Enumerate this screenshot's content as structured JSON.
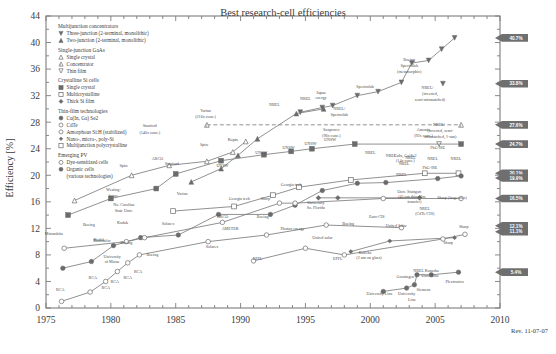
{
  "chart_data": {
    "type": "line",
    "title": "Best research-cell efficiencies",
    "xlabel": "",
    "ylabel": "Efficiency [%]",
    "xlim": [
      1975,
      2010
    ],
    "ylim": [
      0,
      44
    ],
    "xticks": [
      "1975",
      "1980",
      "1985",
      "1990",
      "1995",
      "2000",
      "2005",
      "2010"
    ],
    "yticks": [
      "0",
      "4",
      "8",
      "12",
      "16",
      "20",
      "24",
      "28",
      "32",
      "36",
      "40",
      "44"
    ],
    "grid": false,
    "revision": "Rev. 11-07-07",
    "legend_position": "upper-left-inside",
    "legend_groups": [
      {
        "heading": "Multijunction concentrators",
        "items": [
          {
            "marker": "triangle-down-filled",
            "label": "Three-junction (2-terminal, monolithic)"
          },
          {
            "marker": "triangle-up-filled",
            "label": "Two-junction (2-terminal, monolithic)"
          }
        ]
      },
      {
        "heading": "Single-junction GaAs",
        "items": [
          {
            "marker": "triangle-up-open",
            "label": "Single crystal"
          },
          {
            "marker": "triangle-up-half",
            "label": "Concentrator"
          },
          {
            "marker": "triangle-down-open",
            "label": "Thin film"
          }
        ]
      },
      {
        "heading": "Crystalline Si cells",
        "items": [
          {
            "marker": "square-filled",
            "label": "Single crystal"
          },
          {
            "marker": "square-open",
            "label": "Multicrystalline"
          },
          {
            "marker": "diamond-filled",
            "label": "Thick Si film"
          }
        ]
      },
      {
        "heading": "Thin-film technologies",
        "items": [
          {
            "marker": "circle-filled",
            "label": "Cu(In, Ga) Se2"
          },
          {
            "marker": "circle-open",
            "label": "CdTe"
          },
          {
            "marker": "circle-open",
            "label": "Amorphous Si:H (stabilized)"
          },
          {
            "marker": "diamond-small-filled",
            "label": "Nano-, micro-, poly-Si"
          },
          {
            "marker": "square-open",
            "label": "Multijunction polycrystalline"
          }
        ]
      },
      {
        "heading": "Emerging PV",
        "items": [
          {
            "marker": "circle-open",
            "label": "Dye-sensitized cells"
          },
          {
            "marker": "circle-filled",
            "label": "Organic cells"
          },
          {
            "marker": "none",
            "label": "(various technologies)"
          }
        ]
      }
    ],
    "callouts": [
      {
        "value": "40.7%",
        "y": 40.7
      },
      {
        "value": "33.8%",
        "y": 33.8
      },
      {
        "value": "27.6%",
        "y": 27.6
      },
      {
        "value": "24.7%",
        "y": 24.7
      },
      {
        "value": "20.1%",
        "y": 20.3
      },
      {
        "value": "19.9%",
        "y": 19.6
      },
      {
        "value": "16.5%",
        "y": 16.5
      },
      {
        "value": "12.1%",
        "y": 12.4
      },
      {
        "value": "11.1%",
        "y": 11.5
      },
      {
        "value": "5.4%",
        "y": 5.4
      }
    ],
    "annotations": [
      {
        "text": "Varian",
        "x": 1987.3,
        "y": 29.6
      },
      {
        "text": "(216x conc.)",
        "x": 1987.3,
        "y": 28.6
      },
      {
        "text": "Stanford",
        "x": 1983.0,
        "y": 27.2
      },
      {
        "text": "(140x conc.)",
        "x": 1983.0,
        "y": 26.2
      },
      {
        "text": "Spire",
        "x": 1987.2,
        "y": 24.4
      },
      {
        "text": "Kopin",
        "x": 1989.4,
        "y": 25.2
      },
      {
        "text": "NREL",
        "x": 1992.6,
        "y": 30.4
      },
      {
        "text": "NREL",
        "x": 1995.0,
        "y": 31.4
      },
      {
        "text": "Japan",
        "x": 1996.2,
        "y": 32.3
      },
      {
        "text": "energy",
        "x": 1996.2,
        "y": 31.5
      },
      {
        "text": "Spectrolab",
        "x": 1999.6,
        "y": 33.2
      },
      {
        "text": "NREL/",
        "x": 1997.6,
        "y": 29.9
      },
      {
        "text": "Spectrolab",
        "x": 1997.6,
        "y": 29.0
      },
      {
        "text": "Boeing",
        "x": 2003.0,
        "y": 37.2
      },
      {
        "text": "Spectrolab",
        "x": 2003.0,
        "y": 36.3
      },
      {
        "text": "(metamorphic)",
        "x": 2003.0,
        "y": 35.4
      },
      {
        "text": "NREL/",
        "x": 2004.4,
        "y": 33.0
      },
      {
        "text": "(inverted,",
        "x": 2004.6,
        "y": 32.1
      },
      {
        "text": "semi-mismatched)",
        "x": 2004.6,
        "y": 31.2
      },
      {
        "text": "NREL/",
        "x": 2005.3,
        "y": 27.4
      },
      {
        "text": "(inverted, semi-",
        "x": 2005.4,
        "y": 26.5
      },
      {
        "text": "mismatched, 1-sun)",
        "x": 2005.4,
        "y": 25.6
      },
      {
        "text": "Sunpower",
        "x": 1997.0,
        "y": 26.6
      },
      {
        "text": "(96x conc.)",
        "x": 1997.0,
        "y": 25.8
      },
      {
        "text": "Amonix",
        "x": 2004.1,
        "y": 26.6
      },
      {
        "text": "(92x conc.)",
        "x": 2004.1,
        "y": 25.8
      },
      {
        "text": "FhG-ISE",
        "x": 2005.2,
        "y": 24.0
      },
      {
        "text": "FhG-ISE",
        "x": 2004.6,
        "y": 20.9
      },
      {
        "text": "Stanford",
        "x": 1984.7,
        "y": 21.6
      },
      {
        "text": "Spire",
        "x": 1981.0,
        "y": 21.3
      },
      {
        "text": "Varian",
        "x": 1985.5,
        "y": 17.0
      },
      {
        "text": "ARCO",
        "x": 1983.6,
        "y": 22.3
      },
      {
        "text": "UNSW",
        "x": 1988.6,
        "y": 21.2
      },
      {
        "text": "UNSW",
        "x": 1991.6,
        "y": 23.2
      },
      {
        "text": "UNSW",
        "x": 1993.7,
        "y": 24.0
      },
      {
        "text": "UNSW",
        "x": 1995.4,
        "y": 24.5
      },
      {
        "text": "UNSW",
        "x": 1996.9,
        "y": 25.2
      },
      {
        "text": "NREL",
        "x": 2000.0,
        "y": 23.2
      },
      {
        "text": "NREL",
        "x": 2001.6,
        "y": 22.7
      },
      {
        "text": "NREL",
        "x": 2003.1,
        "y": 22.4
      },
      {
        "text": "NREL",
        "x": 2004.8,
        "y": 22.3
      },
      {
        "text": "NREL",
        "x": 2006.6,
        "y": 22.3
      },
      {
        "text": "NREL",
        "x": 2002.6,
        "y": 21.5
      },
      {
        "text": "NREL",
        "x": 2002.4,
        "y": 19.9
      },
      {
        "text": "CuIn, Ga)Se2",
        "x": 2002.7,
        "y": 22.8
      },
      {
        "text": "(14x conc.)",
        "x": 2002.7,
        "y": 22.0
      },
      {
        "text": "Georgia tech",
        "x": 1989.9,
        "y": 16.2
      },
      {
        "text": "Georgia tech",
        "x": 1993.9,
        "y": 18.4
      },
      {
        "text": "Sharp",
        "x": 1991.9,
        "y": 16.2
      },
      {
        "text": "Univ. Stuttgart",
        "x": 2003.0,
        "y": 17.4
      },
      {
        "text": "(45 um thin-film",
        "x": 2003.2,
        "y": 16.6
      },
      {
        "text": "transfer)",
        "x": 2003.4,
        "y": 15.8
      },
      {
        "text": "Sharp (large-area)",
        "x": 2006.3,
        "y": 16.4
      },
      {
        "text": "NREL",
        "x": 2004.2,
        "y": 14.8
      },
      {
        "text": "(CdTe/CIS)",
        "x": 2004.2,
        "y": 14.0
      },
      {
        "text": "Westing-",
        "x": 1980.2,
        "y": 17.6
      },
      {
        "text": "house",
        "x": 1980.2,
        "y": 16.8
      },
      {
        "text": "No. Carolina",
        "x": 1981.0,
        "y": 15.3
      },
      {
        "text": "State Univ.",
        "x": 1981.0,
        "y": 14.5
      },
      {
        "text": "University",
        "x": 1995.8,
        "y": 15.7
      },
      {
        "text": "So. Florida",
        "x": 1995.8,
        "y": 14.9
      },
      {
        "text": "Euro-CIS",
        "x": 2000.5,
        "y": 13.6
      },
      {
        "text": "Solarex",
        "x": 1984.4,
        "y": 12.5
      },
      {
        "text": "Solarex",
        "x": 1987.8,
        "y": 9.1
      },
      {
        "text": "Kodak",
        "x": 1980.9,
        "y": 12.7
      },
      {
        "text": "Kodak",
        "x": 1979.1,
        "y": 10.1
      },
      {
        "text": "Boeing",
        "x": 1978.3,
        "y": 12.3
      },
      {
        "text": "Boeing",
        "x": 1981.2,
        "y": 9.7
      },
      {
        "text": "Boeing",
        "x": 1991.7,
        "y": 13.6
      },
      {
        "text": "Boeing",
        "x": 1998.3,
        "y": 12.5
      },
      {
        "text": "ARCO",
        "x": 1988.6,
        "y": 13.6
      },
      {
        "text": "AMETEK",
        "x": 1989.2,
        "y": 11.7
      },
      {
        "text": "Photon energy",
        "x": 1994.0,
        "y": 11.8
      },
      {
        "text": "Matsushita",
        "x": 1975.6,
        "y": 11.0
      },
      {
        "text": "Monosolar",
        "x": 1979.3,
        "y": 9.9
      },
      {
        "text": "University",
        "x": 1980.1,
        "y": 7.6
      },
      {
        "text": "of Maine",
        "x": 1980.1,
        "y": 6.8
      },
      {
        "text": "Boeing",
        "x": 1983.2,
        "y": 7.9
      },
      {
        "text": "United solar",
        "x": 1996.3,
        "y": 10.4
      },
      {
        "text": "United Solar",
        "x": 2002.0,
        "y": 12.2
      },
      {
        "text": "EPFL",
        "x": 1991.3,
        "y": 7.3
      },
      {
        "text": "EPFL",
        "x": 1997.5,
        "y": 7.2
      },
      {
        "text": "Kaneka",
        "x": 1999.6,
        "y": 8.2
      },
      {
        "text": "(2 um on glass)",
        "x": 1999.9,
        "y": 7.4
      },
      {
        "text": "Sharp",
        "x": 2006.0,
        "y": 9.6
      },
      {
        "text": "Sharp",
        "x": 2007.2,
        "y": 12.1
      },
      {
        "text": "RCA",
        "x": 1976.1,
        "y": 2.6
      },
      {
        "text": "RCA",
        "x": 1978.6,
        "y": 4.4
      },
      {
        "text": "RCA",
        "x": 1979.6,
        "y": 2.9
      },
      {
        "text": "RCA",
        "x": 1980.3,
        "y": 3.8
      },
      {
        "text": "RCA",
        "x": 1981.3,
        "y": 4.4
      },
      {
        "text": "RCA",
        "x": 1982.1,
        "y": 5.2
      },
      {
        "text": "University Linz",
        "x": 2000.7,
        "y": 1.9
      },
      {
        "text": "University",
        "x": 2002.8,
        "y": 1.9
      },
      {
        "text": "Linz",
        "x": 2003.2,
        "y": 1.1
      },
      {
        "text": "Groningen",
        "x": 2002.7,
        "y": 4.5
      },
      {
        "text": "Siemens",
        "x": 2004.1,
        "y": 2.6
      },
      {
        "text": "NREL Konarka",
        "x": 2004.3,
        "y": 5.5
      },
      {
        "text": "Univ. Linz",
        "x": 2004.6,
        "y": 4.7
      },
      {
        "text": "Plextronics",
        "x": 2006.5,
        "y": 3.7
      }
    ],
    "series": [
      {
        "name": "Three-junction concentrator",
        "marker": "triangle-down-filled",
        "points": [
          [
            1994.6,
            29.5
          ],
          [
            1996.3,
            30.2
          ],
          [
            1997.1,
            30.5
          ],
          [
            1999.0,
            32.0
          ],
          [
            2000.6,
            32.6
          ],
          [
            2002.4,
            34.0
          ],
          [
            2003.2,
            36.9
          ],
          [
            2004.5,
            37.3
          ],
          [
            2005.5,
            39.0
          ],
          [
            2006.5,
            40.7
          ]
        ]
      },
      {
        "name": "Three-junction 1-sun",
        "marker": "triangle-down-filled",
        "points": [
          [
            2005.6,
            33.8
          ]
        ]
      },
      {
        "name": "Two-junction concentrator",
        "marker": "triangle-up-filled",
        "points": [
          [
            1986.2,
            19.0
          ],
          [
            1988.5,
            21.0
          ],
          [
            1989.8,
            23.0
          ],
          [
            1991.3,
            25.5
          ],
          [
            1994.3,
            29.3
          ],
          [
            1996.4,
            30.0
          ]
        ]
      },
      {
        "name": "GaAs concentrator",
        "marker": "triangle-up-half",
        "points": [
          [
            1987.4,
            27.6
          ],
          [
            2007.0,
            27.6
          ]
        ]
      },
      {
        "name": "GaAs single crystal",
        "marker": "triangle-up-open",
        "points": [
          [
            1977.2,
            16.2
          ],
          [
            1981.6,
            20.0
          ],
          [
            1984.5,
            21.5
          ],
          [
            1987.4,
            22.1
          ],
          [
            1989.4,
            23.5
          ],
          [
            1990.4,
            25.1
          ]
        ]
      },
      {
        "name": "GaAs thin film",
        "marker": "triangle-down-open",
        "points": [
          [
            2005.3,
            24.7
          ]
        ]
      },
      {
        "name": "Si single crystal",
        "marker": "square-filled",
        "points": [
          [
            1976.7,
            14.0
          ],
          [
            1980.0,
            16.5
          ],
          [
            1983.5,
            18.0
          ],
          [
            1985.0,
            20.2
          ],
          [
            1988.5,
            22.2
          ],
          [
            1991.8,
            23.1
          ],
          [
            1993.9,
            23.6
          ],
          [
            1995.5,
            24.0
          ],
          [
            1998.8,
            24.7
          ],
          [
            2007.0,
            24.7
          ]
        ]
      },
      {
        "name": "Si multicrystalline",
        "marker": "square-open",
        "points": [
          [
            1984.8,
            14.6
          ],
          [
            1989.5,
            15.3
          ],
          [
            1992.5,
            17.0
          ],
          [
            1994.5,
            18.2
          ],
          [
            1998.5,
            19.3
          ],
          [
            2004.2,
            20.3
          ],
          [
            2006.8,
            20.3
          ]
        ]
      },
      {
        "name": "Thick Si film",
        "marker": "diamond-filled",
        "points": [
          [
            1996.0,
            16.6
          ],
          [
            1997.5,
            16.6
          ],
          [
            2003.8,
            16.6
          ]
        ]
      },
      {
        "name": "CIGS",
        "marker": "circle-filled",
        "points": [
          [
            1976.3,
            6.0
          ],
          [
            1978.5,
            7.0
          ],
          [
            1980.2,
            9.4
          ],
          [
            1982.3,
            10.6
          ],
          [
            1985.2,
            11.0
          ],
          [
            1988.3,
            14.1
          ],
          [
            1992.3,
            14.1
          ],
          [
            1994.2,
            15.5
          ],
          [
            1996.3,
            17.7
          ],
          [
            1999.0,
            18.8
          ],
          [
            2001.2,
            18.9
          ],
          [
            2005.2,
            19.5
          ],
          [
            2007.0,
            19.9
          ]
        ]
      },
      {
        "name": "CdTe",
        "marker": "circle-open",
        "points": [
          [
            1976.4,
            9.0
          ],
          [
            1981.2,
            10.0
          ],
          [
            1982.6,
            10.6
          ],
          [
            1988.6,
            12.9
          ],
          [
            1993.0,
            15.8
          ],
          [
            1994.2,
            15.8
          ],
          [
            2001.0,
            16.5
          ],
          [
            2007.0,
            16.5
          ]
        ]
      },
      {
        "name": "Amorphous Si:H",
        "marker": "circle-open",
        "points": [
          [
            1976.2,
            1.0
          ],
          [
            1978.4,
            2.4
          ],
          [
            1979.6,
            4.0
          ],
          [
            1980.5,
            5.5
          ],
          [
            1981.3,
            6.8
          ],
          [
            1982.2,
            8.0
          ],
          [
            1987.5,
            10.0
          ],
          [
            1992.0,
            11.0
          ],
          [
            1996.6,
            12.5
          ],
          [
            2002.4,
            12.1
          ]
        ]
      },
      {
        "name": "Nano/micro/poly-Si",
        "marker": "diamond-small-filled",
        "points": [
          [
            1998.5,
            8.5
          ],
          [
            2001.5,
            10.1
          ],
          [
            2006.5,
            10.6
          ]
        ]
      },
      {
        "name": "Dye-sensitized",
        "marker": "circle-open",
        "points": [
          [
            1991.0,
            7.1
          ],
          [
            1995.0,
            9.0
          ],
          [
            1998.0,
            8.0
          ],
          [
            2005.6,
            10.4
          ],
          [
            2007.3,
            11.1
          ]
        ]
      },
      {
        "name": "Organic cells",
        "marker": "circle-filled",
        "points": [
          [
            2001.0,
            2.5
          ],
          [
            2002.8,
            3.0
          ],
          [
            2003.4,
            3.5
          ],
          [
            2003.6,
            5.0
          ],
          [
            2004.7,
            5.0
          ],
          [
            2006.8,
            5.4
          ]
        ]
      }
    ]
  }
}
